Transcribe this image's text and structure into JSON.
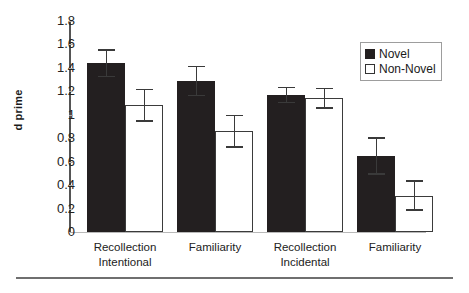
{
  "chart_data": {
    "type": "bar",
    "title": "",
    "subtitle": "",
    "xlabel": "",
    "ylabel": "d prime",
    "ylim": [
      0,
      1.8
    ],
    "yticks": [
      "0",
      "0.2",
      "0.4",
      "0.6",
      "0.8",
      "1",
      "1.2",
      "1.4",
      "1.6",
      "1.8"
    ],
    "ytick_values": [
      0,
      0.2,
      0.4,
      0.6,
      0.8,
      1.0,
      1.2,
      1.4,
      1.6,
      1.8
    ],
    "grid": false,
    "legend_position": "top-right",
    "categories": [
      {
        "line1": "Recollection",
        "line2": "Intentional"
      },
      {
        "line1": "Familiarity",
        "line2": ""
      },
      {
        "line1": "Recollection",
        "line2": "Incidental"
      },
      {
        "line1": "Familiarity",
        "line2": ""
      }
    ],
    "series": [
      {
        "name": "Novel",
        "color": "#231f20",
        "values": [
          1.44,
          1.29,
          1.17,
          0.65
        ],
        "errors": [
          0.12,
          0.13,
          0.07,
          0.16
        ]
      },
      {
        "name": "Non-Novel",
        "color": "#ffffff",
        "values": [
          1.08,
          0.86,
          1.14,
          0.31
        ],
        "errors": [
          0.14,
          0.14,
          0.09,
          0.13
        ]
      }
    ]
  },
  "legend": {
    "items": [
      {
        "label": "Novel",
        "swatch": "filled-black-square-icon"
      },
      {
        "label": "Non-Novel",
        "swatch": "outlined-white-square-icon"
      }
    ]
  },
  "axes": {
    "y_title": "d prime"
  }
}
